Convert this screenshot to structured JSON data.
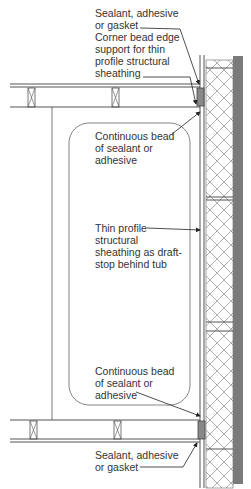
{
  "diagram": {
    "type": "construction-section-detail",
    "colors": {
      "line": "#555555",
      "wall_dark": "#7a7a7a",
      "label_text": "#333333",
      "background": "#ffffff"
    },
    "labels": {
      "top_sealant": "Sealant, adhesive\nor gasket",
      "corner_bead": "Corner bead edge\nsupport for thin\nprofile structural\nsheathing",
      "top_continuous_bead": "Continuous bead\nof sealant or\nadhesive",
      "thin_profile": "Thin profile\nstructural\nsheathing as draft-\nstop behind tub",
      "bottom_continuous_bead": "Continuous bead\nof sealant or\nadhesive",
      "bottom_sealant": "Sealant, adhesive\nor gasket"
    }
  }
}
